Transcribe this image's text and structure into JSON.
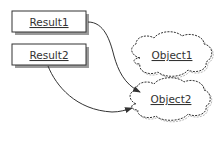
{
  "diagram": {
    "nodes": [
      {
        "id": "result1",
        "label": "Result1",
        "shape": "rectangle"
      },
      {
        "id": "result2",
        "label": "Result2",
        "shape": "rectangle"
      },
      {
        "id": "object1",
        "label": "Object1",
        "shape": "cloud"
      },
      {
        "id": "object2",
        "label": "Object2",
        "shape": "cloud"
      }
    ],
    "edges": [
      {
        "from": "result1",
        "to": "object2"
      },
      {
        "from": "result2",
        "to": "object2"
      }
    ],
    "colors": {
      "stroke": "#333333",
      "shadow": "#9a9a9a",
      "background": "#ffffff"
    }
  }
}
